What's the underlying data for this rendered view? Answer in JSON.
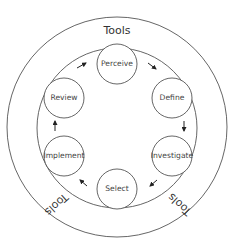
{
  "diagram": {
    "type": "cycle",
    "outer_ring": {
      "cx": 117,
      "cy": 127,
      "r": 110
    },
    "inner_ring": {
      "cx": 117,
      "cy": 128,
      "r": 80
    },
    "tools_labels": [
      {
        "text": "Tools",
        "x": 117,
        "y": 31,
        "rotate": 0
      },
      {
        "text": "Tools",
        "x": 56,
        "y": 204,
        "rotate": 138
      },
      {
        "text": "Tools",
        "x": 180,
        "y": 204,
        "rotate": -138
      }
    ],
    "nodes": [
      {
        "id": "perceive",
        "label": "Perceive",
        "cx": 117,
        "cy": 64,
        "r": 20
      },
      {
        "id": "define",
        "label": "Define",
        "cx": 172,
        "cy": 98,
        "r": 20
      },
      {
        "id": "investigate",
        "label": "Investigate",
        "cx": 172,
        "cy": 156,
        "r": 20
      },
      {
        "id": "select",
        "label": "Select",
        "cx": 117,
        "cy": 189,
        "r": 20
      },
      {
        "id": "implement",
        "label": "Implement",
        "cx": 64,
        "cy": 156,
        "r": 20
      },
      {
        "id": "review",
        "label": "Review",
        "cx": 64,
        "cy": 98,
        "r": 20
      }
    ],
    "arrows": [
      {
        "from": "review",
        "to": "perceive",
        "x1": 77,
        "y1": 68,
        "x2": 86,
        "y2": 63
      },
      {
        "from": "perceive",
        "to": "define",
        "x1": 148,
        "y1": 63,
        "x2": 156,
        "y2": 69
      },
      {
        "from": "define",
        "to": "investigate",
        "x1": 184,
        "y1": 121,
        "x2": 184,
        "y2": 131
      },
      {
        "from": "investigate",
        "to": "select",
        "x1": 157,
        "y1": 180,
        "x2": 150,
        "y2": 186
      },
      {
        "from": "select",
        "to": "implement",
        "x1": 87,
        "y1": 186,
        "x2": 80,
        "y2": 180
      },
      {
        "from": "implement",
        "to": "review",
        "x1": 55,
        "y1": 131,
        "x2": 55,
        "y2": 121
      }
    ]
  }
}
